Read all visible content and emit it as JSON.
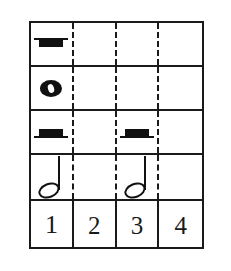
{
  "figure": {
    "kind": "music-rhythm-grid",
    "columns": 4,
    "rows": 5,
    "ink_color": "#1a1a1a",
    "background_color": "#ffffff"
  },
  "rows": [
    {
      "id": "row-whole-rest",
      "label": "whole rest row",
      "cells": [
        {
          "beat": 1,
          "symbol": "whole-rest",
          "symbol_label": "whole rest"
        },
        {
          "beat": 2,
          "symbol": "",
          "symbol_label": ""
        },
        {
          "beat": 3,
          "symbol": "",
          "symbol_label": ""
        },
        {
          "beat": 4,
          "symbol": "",
          "symbol_label": ""
        }
      ]
    },
    {
      "id": "row-whole-note",
      "label": "whole note row",
      "cells": [
        {
          "beat": 1,
          "symbol": "whole-note",
          "symbol_label": "whole note"
        },
        {
          "beat": 2,
          "symbol": "",
          "symbol_label": ""
        },
        {
          "beat": 3,
          "symbol": "",
          "symbol_label": ""
        },
        {
          "beat": 4,
          "symbol": "",
          "symbol_label": ""
        }
      ]
    },
    {
      "id": "row-half-rests",
      "label": "half rest row",
      "cells": [
        {
          "beat": 1,
          "symbol": "half-rest",
          "symbol_label": "half rest"
        },
        {
          "beat": 2,
          "symbol": "",
          "symbol_label": ""
        },
        {
          "beat": 3,
          "symbol": "half-rest",
          "symbol_label": "half rest"
        },
        {
          "beat": 4,
          "symbol": "",
          "symbol_label": ""
        }
      ]
    },
    {
      "id": "row-half-notes",
      "label": "half note row",
      "cells": [
        {
          "beat": 1,
          "symbol": "half-note",
          "symbol_label": "half note"
        },
        {
          "beat": 2,
          "symbol": "",
          "symbol_label": ""
        },
        {
          "beat": 3,
          "symbol": "half-note",
          "symbol_label": "half note"
        },
        {
          "beat": 4,
          "symbol": "",
          "symbol_label": ""
        }
      ]
    }
  ],
  "beat_numbers": {
    "id": "row-beat-numbers",
    "label": "beat count row",
    "values": [
      "1",
      "2",
      "3",
      "4"
    ]
  }
}
